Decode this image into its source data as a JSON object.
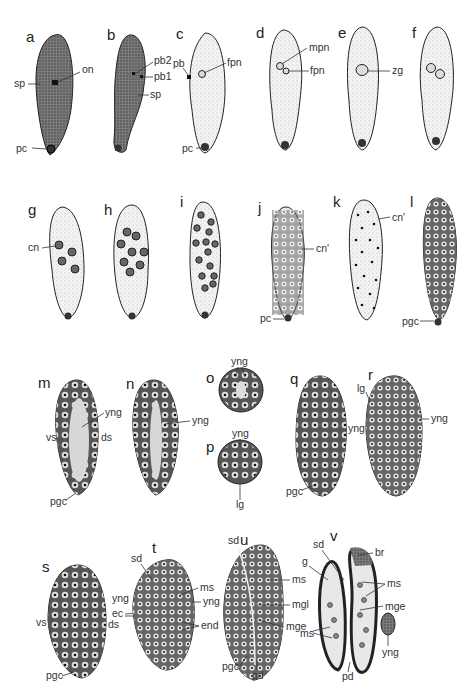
{
  "figure": {
    "panels": [
      {
        "id": "a",
        "labels": [
          "sp",
          "on",
          "pc"
        ]
      },
      {
        "id": "b",
        "labels": [
          "pb2",
          "pb1",
          "sp"
        ]
      },
      {
        "id": "c",
        "labels": [
          "pb",
          "fpn",
          "pc"
        ]
      },
      {
        "id": "d",
        "labels": [
          "mpn",
          "fpn"
        ]
      },
      {
        "id": "e",
        "labels": [
          "zg"
        ]
      },
      {
        "id": "f",
        "labels": []
      },
      {
        "id": "g",
        "labels": [
          "cn"
        ]
      },
      {
        "id": "h",
        "labels": []
      },
      {
        "id": "i",
        "labels": []
      },
      {
        "id": "j",
        "labels": [
          "cn'",
          "pc"
        ]
      },
      {
        "id": "k",
        "labels": [
          "cn'"
        ]
      },
      {
        "id": "l",
        "labels": [
          "pgc"
        ]
      },
      {
        "id": "m",
        "labels": [
          "yng",
          "vs",
          "ds",
          "pgc"
        ]
      },
      {
        "id": "n",
        "labels": [
          "yng"
        ]
      },
      {
        "id": "o",
        "labels": [
          "yng"
        ]
      },
      {
        "id": "p",
        "labels": [
          "yng",
          "lg"
        ]
      },
      {
        "id": "q",
        "labels": [
          "yng",
          "pgc"
        ]
      },
      {
        "id": "r",
        "labels": [
          "lg",
          "yng"
        ]
      },
      {
        "id": "s",
        "labels": [
          "yng",
          "vs",
          "ec",
          "ds",
          "pgc"
        ]
      },
      {
        "id": "t",
        "labels": [
          "sd",
          "ms",
          "yng",
          "end"
        ]
      },
      {
        "id": "u",
        "labels": [
          "sd",
          "ms",
          "mgl",
          "mge",
          "pgc",
          "pd"
        ]
      },
      {
        "id": "v",
        "labels": [
          "sd",
          "br",
          "g",
          "ms",
          "mge",
          "ms",
          "yng",
          "pd"
        ]
      }
    ]
  },
  "colors": {
    "ink": "#222222",
    "light_fill": "#f1f1f1",
    "dark_fill": "#6a6a6a",
    "mid_fill": "#9a9a9a"
  }
}
